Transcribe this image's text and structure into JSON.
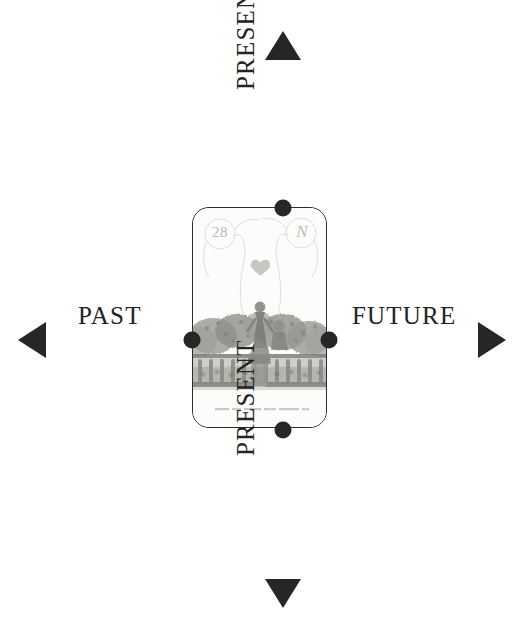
{
  "diagram": {
    "type": "time-axis-cross",
    "background_color": "#ffffff",
    "line_color": "#2b2b2b",
    "node_color": "#262626",
    "labels": {
      "past": "PAST",
      "future": "FUTURE",
      "present_top": "PRESENT",
      "present_bottom": "PRESENT"
    },
    "axes": [
      {
        "name": "horizontal-axis",
        "orientation": "horizontal",
        "from_label": "PAST",
        "to_label": "FUTURE",
        "start_x": 20,
        "end_x": 505,
        "y": 340,
        "arrowheads": [
          "left",
          "right"
        ]
      },
      {
        "name": "vertical-axis",
        "orientation": "vertical",
        "from_label": "PRESENT",
        "to_label": "PRESENT",
        "start_y": 32,
        "end_y": 607,
        "x": 283,
        "arrowheads": [
          "up",
          "down"
        ]
      }
    ],
    "nodes": [
      {
        "name": "node-top",
        "x": 283,
        "y": 208,
        "radius": 8
      },
      {
        "name": "node-bottom",
        "x": 283,
        "y": 430,
        "radius": 8
      },
      {
        "name": "node-left",
        "x": 192,
        "y": 340,
        "radius": 8
      },
      {
        "name": "node-right",
        "x": 328,
        "y": 340,
        "radius": 8
      }
    ]
  },
  "card": {
    "name": "tarot-card",
    "number": "28",
    "monogram": "N",
    "center_motif": "heart",
    "illustration": "vintage engraving of a figure standing on a garden terrace with a stone balustrade, shrubs and trees behind",
    "caption": "",
    "border_radius_px": 17,
    "x": 192,
    "y": 207,
    "width": 135,
    "height": 221
  }
}
